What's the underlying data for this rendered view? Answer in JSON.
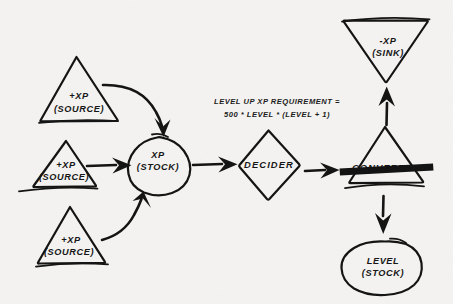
{
  "diagram": {
    "background_color": "#f4f3f1",
    "ink_color": "#121212",
    "annotation": {
      "line1": "LEVEL UP XP REQUIREMENT =",
      "line2": "500 * LEVEL * (LEVEL + 1)"
    },
    "nodes": [
      {
        "id": "source-1",
        "shape": "triangle",
        "main": "+XP",
        "sub": "(SOURCE)"
      },
      {
        "id": "source-2",
        "shape": "triangle",
        "main": "+XP",
        "sub": "(SOURCE)"
      },
      {
        "id": "source-3",
        "shape": "triangle",
        "main": "+XP",
        "sub": "(SOURCE)"
      },
      {
        "id": "xp-stock",
        "shape": "blob",
        "main": "XP",
        "sub": "(STOCK)"
      },
      {
        "id": "decider",
        "shape": "diamond",
        "main": "DECIDER",
        "sub": ""
      },
      {
        "id": "converter",
        "shape": "triangle-with-bar",
        "main": "CONVERTER",
        "sub": ""
      },
      {
        "id": "xp-sink",
        "shape": "inverted-triangle",
        "main": "-XP",
        "sub": "(SINK)"
      },
      {
        "id": "level-stock",
        "shape": "blob",
        "main": "LEVEL",
        "sub": "(STOCK)"
      }
    ],
    "edges": [
      {
        "from": "source-1",
        "to": "xp-stock",
        "style": "curved-arrow"
      },
      {
        "from": "source-2",
        "to": "xp-stock",
        "style": "straight-arrow"
      },
      {
        "from": "source-3",
        "to": "xp-stock",
        "style": "curved-arrow"
      },
      {
        "from": "xp-stock",
        "to": "decider",
        "style": "straight-arrow"
      },
      {
        "from": "decider",
        "to": "converter",
        "style": "straight-arrow"
      },
      {
        "from": "converter",
        "to": "xp-sink",
        "style": "straight-arrow-up"
      },
      {
        "from": "converter",
        "to": "level-stock",
        "style": "straight-arrow-down"
      }
    ]
  }
}
